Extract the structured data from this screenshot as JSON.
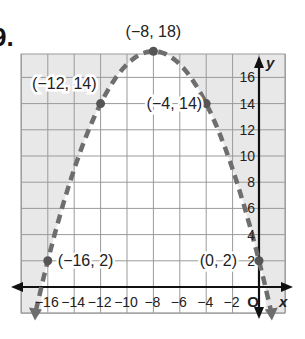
{
  "problem": {
    "number": "9."
  },
  "chart_data": {
    "type": "line",
    "title": "",
    "xlabel": "x",
    "ylabel": "y",
    "xlim": [
      -18,
      2
    ],
    "ylim": [
      -2,
      18
    ],
    "grid": true,
    "origin_label": "O",
    "x_tick_labels": [
      "−16",
      "−14",
      "−12",
      "−10",
      "−8",
      "−6",
      "−4",
      "−2"
    ],
    "x_ticks": [
      -16,
      -14,
      -12,
      -10,
      -8,
      -6,
      -4,
      -2
    ],
    "y_tick_labels": [
      "2",
      "4",
      "6",
      "8",
      "10",
      "12",
      "14",
      "16"
    ],
    "y_ticks": [
      2,
      4,
      6,
      8,
      10,
      12,
      14,
      16
    ],
    "series": [
      {
        "name": "y = -(x + 8)^2/4 + 18",
        "style": "dashed",
        "shading": "outside (y < curve complement shaded gray)",
        "points": [
          {
            "x": -16,
            "y": 2,
            "label": "(−16, 2)"
          },
          {
            "x": -12,
            "y": 14,
            "label": "(−12, 14)"
          },
          {
            "x": -8,
            "y": 18,
            "label": "(−8, 18)"
          },
          {
            "x": -4,
            "y": 14,
            "label": "(−4, 14)"
          },
          {
            "x": 0,
            "y": 2,
            "label": "(0, 2)"
          }
        ]
      }
    ],
    "colors": {
      "curve": "#6e6e6e",
      "shade": "#e8e8e8",
      "grid": "#9a9a9a",
      "axis": "#111111"
    }
  }
}
